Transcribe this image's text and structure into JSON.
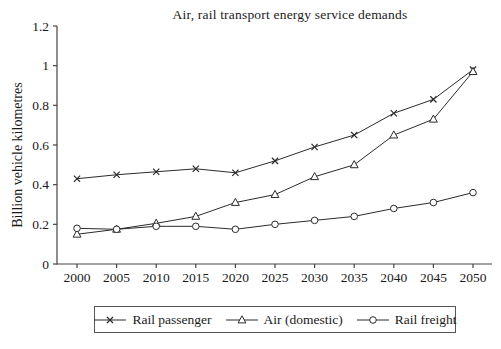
{
  "chart_data": {
    "type": "line",
    "title": "Air, rail transport energy service demands",
    "xlabel": "",
    "ylabel": "Billion vehicle kilometres",
    "x": [
      2000,
      2005,
      2010,
      2015,
      2020,
      2025,
      2030,
      2035,
      2040,
      2045,
      2050
    ],
    "ylim": [
      0,
      1.2
    ],
    "ytick_values": [
      0,
      0.2,
      0.4,
      0.6,
      0.8,
      1,
      1.2
    ],
    "ytick_labels": [
      "0",
      "0.2",
      "0.4",
      "0.6",
      "0.8",
      "1",
      "1.2"
    ],
    "grid": false,
    "legend_position": "bottom",
    "axis_color": "#444444",
    "line_color": "#2b2b2b",
    "series": [
      {
        "name": "Rail passenger",
        "marker": "x",
        "values": [
          0.43,
          0.45,
          0.465,
          0.48,
          0.46,
          0.52,
          0.59,
          0.65,
          0.76,
          0.83,
          0.98
        ]
      },
      {
        "name": "Air (domestic)",
        "marker": "triangle",
        "values": [
          0.15,
          0.175,
          0.205,
          0.24,
          0.31,
          0.35,
          0.44,
          0.5,
          0.65,
          0.73,
          0.97
        ]
      },
      {
        "name": "Rail freight",
        "marker": "circle",
        "values": [
          0.18,
          0.175,
          0.19,
          0.19,
          0.175,
          0.2,
          0.22,
          0.24,
          0.28,
          0.31,
          0.36
        ]
      }
    ]
  }
}
